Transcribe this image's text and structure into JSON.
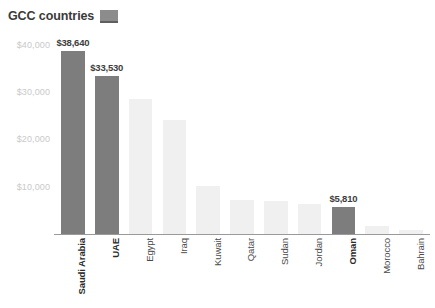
{
  "legend": {
    "label": "GCC countries",
    "swatch_color": "#8c8c8c",
    "swatch_icon": "legend-swatch-icon"
  },
  "colors": {
    "highlight_bar": "#7d7d7d",
    "normal_bar": "#f0f0f0",
    "axis": "#9a9a9a",
    "tick_text": "#c9c9c9",
    "label_text": "#4a4a4a"
  },
  "axis": {
    "y_ticks": [
      "$10,000",
      "$20,000",
      "$30,000",
      "$40,000"
    ],
    "y_tick_values": [
      10000,
      20000,
      30000,
      40000
    ],
    "y_min": 0,
    "y_max": 44000
  },
  "chart_data": {
    "type": "bar",
    "title": "",
    "subtitle": "",
    "xlabel": "",
    "ylabel": "",
    "ylim": [
      0,
      44000
    ],
    "grid": false,
    "legend_position": "top-left",
    "legend_entries": [
      "GCC countries"
    ],
    "categories": [
      "Saudi Arabia",
      "UAE",
      "Egypt",
      "Iraq",
      "Kuwait",
      "Qatar",
      "Sudan",
      "Jordan",
      "Oman",
      "Morocco",
      "Bahrain"
    ],
    "values": [
      38640,
      33530,
      28500,
      24200,
      10100,
      7100,
      6900,
      6300,
      5810,
      1600,
      900
    ],
    "highlighted": [
      true,
      true,
      false,
      false,
      false,
      false,
      false,
      false,
      true,
      false,
      false
    ],
    "annotations": [
      {
        "category": "Saudi Arabia",
        "text": "$38,640"
      },
      {
        "category": "UAE",
        "text": "$33,530"
      },
      {
        "category": "Oman",
        "text": "$5,810"
      }
    ],
    "data_labels": [
      "$38,640",
      "$33,530",
      "",
      "",
      "",
      "",
      "",
      "",
      "$5,810",
      "",
      ""
    ],
    "y_tick_labels": [
      "$10,000",
      "$20,000",
      "$30,000",
      "$40,000"
    ]
  }
}
